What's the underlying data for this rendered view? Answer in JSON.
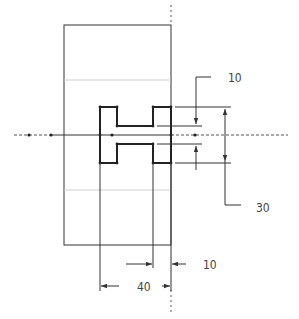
{
  "drawing": {
    "type": "engineering-sketch",
    "shape": "H-profile section",
    "colors": {
      "line": "#222222",
      "thin": "#555555",
      "faint": "#cfcfcf",
      "text": "#444444"
    },
    "dimensions": {
      "top_gap": "10",
      "overall_height": "30",
      "flange_width": "10",
      "overall_width": "40"
    }
  }
}
